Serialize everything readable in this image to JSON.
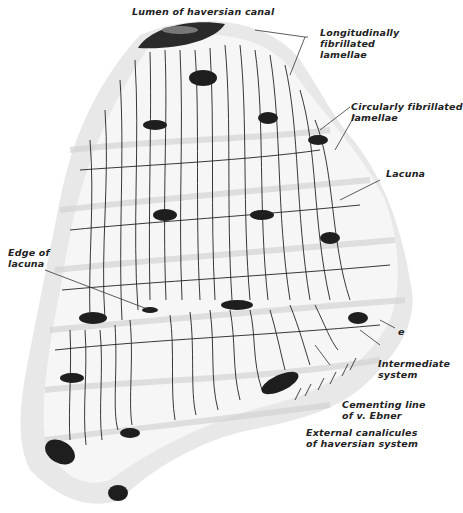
{
  "figure": {
    "labels": {
      "lumen": "Lumen of haversian canal",
      "longitudinal": "Longitudinally\nfibrillated\nlamellae",
      "circular": "Circularly fibrillated\nlamellae",
      "lacuna": "Lacuna",
      "edge_of_lacuna": "Edge of\nlacuna",
      "e": "e",
      "intermediate": "Intermediate\nsystem",
      "cementing": "Cementing line\nof v. Ebner",
      "external": "External canalicules\nof haversian system"
    },
    "colors": {
      "ink": "#1a1a1a",
      "shade": "#cfcfcf",
      "background": "#ffffff"
    }
  }
}
